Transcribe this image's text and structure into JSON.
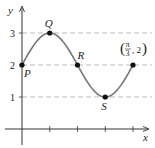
{
  "chart_data": {
    "type": "line",
    "title": "",
    "function": "y = 2 + sin(6x)",
    "xlabel": "x",
    "ylabel": "y",
    "xlim": [
      0,
      1.1781
    ],
    "ylim": [
      0,
      3.3
    ],
    "y_ticks": [
      1,
      2,
      3
    ],
    "y_tick_labels": [
      "1",
      "2",
      "3"
    ],
    "x_ticks": [
      0.2618,
      0.5236,
      0.7854,
      1.0472
    ],
    "x_tick_labels": [
      "",
      "",
      "",
      ""
    ],
    "grid": "dashed horizontal lines at y=1, 2, 3",
    "series": [
      {
        "name": "curve",
        "x_start": 0,
        "x_end": 1.0472
      }
    ],
    "points": [
      {
        "label": "P",
        "x": 0,
        "y": 2
      },
      {
        "label": "Q",
        "x": 0.2618,
        "y": 3
      },
      {
        "label": "R",
        "x": 0.5236,
        "y": 2
      },
      {
        "label": "S",
        "x": 0.7854,
        "y": 1
      },
      {
        "label": "(π/3, 2)",
        "x": 1.0472,
        "y": 2
      }
    ],
    "end_label": {
      "num": "π",
      "den": "3",
      "y": "2"
    },
    "legend": "none"
  }
}
